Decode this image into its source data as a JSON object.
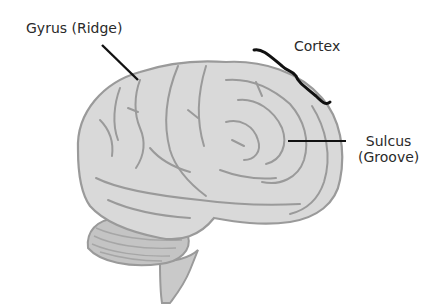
{
  "diagram": {
    "labels": {
      "gyrus": "Gyrus (Ridge)",
      "cortex": "Cortex",
      "sulcus_line1": "Sulcus",
      "sulcus_line2": "(Groove)"
    },
    "colors": {
      "brain_fill": "#d9d9d9",
      "brain_fold": "#9a9a9a",
      "cerebellum_fill": "#c4c4c4",
      "leader_line": "#111111",
      "text": "#2a2a2a"
    }
  }
}
